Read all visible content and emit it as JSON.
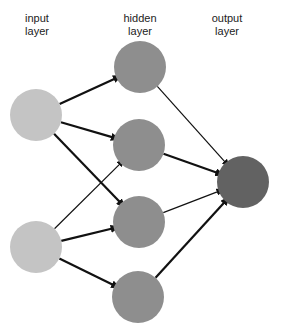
{
  "labels": {
    "input": [
      "input",
      "layer"
    ],
    "hidden": [
      "hidden",
      "layer"
    ],
    "output": [
      "output",
      "layer"
    ]
  },
  "colors": {
    "input_node": "#c4c4c4",
    "hidden_node": "#8e8e8e",
    "output_node": "#626262",
    "edge": "#111111",
    "background": "#ffffff"
  },
  "nodes": [
    {
      "id": "input-1",
      "layer": "input",
      "cx": 36,
      "cy": 115,
      "r": 26
    },
    {
      "id": "input-2",
      "layer": "input",
      "cx": 36,
      "cy": 247,
      "r": 26
    },
    {
      "id": "hidden-1",
      "layer": "hidden",
      "cx": 140,
      "cy": 67,
      "r": 26
    },
    {
      "id": "hidden-2",
      "layer": "hidden",
      "cx": 139,
      "cy": 145,
      "r": 26
    },
    {
      "id": "hidden-3",
      "layer": "hidden",
      "cx": 139,
      "cy": 222,
      "r": 26
    },
    {
      "id": "hidden-4",
      "layer": "hidden",
      "cx": 138,
      "cy": 297,
      "r": 26
    },
    {
      "id": "output-1",
      "layer": "output",
      "cx": 243,
      "cy": 182,
      "r": 26
    }
  ],
  "edges": [
    {
      "from": "input-1",
      "to": "hidden-1",
      "weight": "thick"
    },
    {
      "from": "input-1",
      "to": "hidden-2",
      "weight": "thick"
    },
    {
      "from": "input-1",
      "to": "hidden-3",
      "weight": "thick"
    },
    {
      "from": "input-2",
      "to": "hidden-2",
      "weight": "thin"
    },
    {
      "from": "input-2",
      "to": "hidden-3",
      "weight": "thick"
    },
    {
      "from": "input-2",
      "to": "hidden-4",
      "weight": "thick"
    },
    {
      "from": "hidden-1",
      "to": "output-1",
      "weight": "thin"
    },
    {
      "from": "hidden-2",
      "to": "output-1",
      "weight": "thick"
    },
    {
      "from": "hidden-3",
      "to": "output-1",
      "weight": "thin"
    },
    {
      "from": "hidden-4",
      "to": "output-1",
      "weight": "thick"
    }
  ]
}
